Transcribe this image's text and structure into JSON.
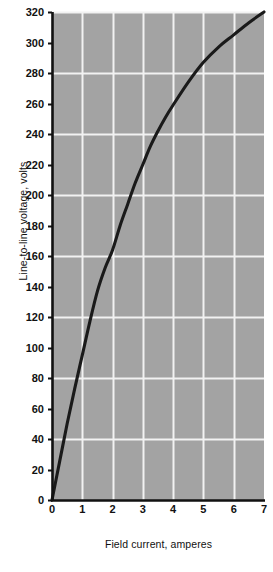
{
  "chart_data": {
    "type": "line",
    "title": "",
    "subtitle": "",
    "xlabel": "Field current, amperes",
    "ylabel": "Line-to-line voltage, volts",
    "xlim": [
      0,
      7
    ],
    "ylim": [
      0,
      320
    ],
    "grid": true,
    "legend": null,
    "xticks": [
      "0",
      "1",
      "2",
      "3",
      "4",
      "5",
      "6",
      "7"
    ],
    "xtick_values": [
      0,
      1,
      2,
      3,
      4,
      5,
      6,
      7
    ],
    "yticks": [
      "0",
      "20",
      "40",
      "60",
      "80",
      "100",
      "120",
      "140",
      "160",
      "180",
      "200",
      "220",
      "240",
      "260",
      "280",
      "300",
      "320"
    ],
    "ytick_values": [
      0,
      20,
      40,
      60,
      80,
      100,
      120,
      140,
      160,
      180,
      200,
      220,
      240,
      260,
      280,
      300,
      320
    ],
    "series": [
      {
        "name": "Open-circuit saturation curve",
        "x": [
          0.0,
          0.25,
          0.5,
          0.75,
          1.0,
          1.25,
          1.5,
          1.75,
          2.0,
          2.25,
          2.5,
          2.75,
          3.0,
          3.25,
          3.5,
          3.75,
          4.0,
          4.5,
          5.0,
          5.5,
          6.0,
          6.5,
          7.0
        ],
        "values": [
          0,
          25,
          50,
          73,
          95,
          117,
          137,
          152,
          164,
          180,
          194,
          208,
          220,
          232,
          242,
          251,
          259,
          274,
          287,
          297,
          305,
          313,
          320
        ]
      }
    ],
    "colors": {
      "plot_background": "#a3a3a3",
      "gridline": "#f2f2f2",
      "curve": "#1a1a1a",
      "axis": "#111111",
      "text": "#111111",
      "page_background": "#ffffff"
    }
  }
}
